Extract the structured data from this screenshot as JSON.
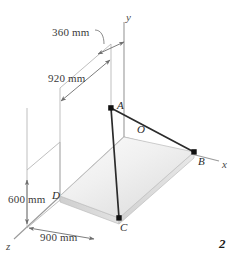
{
  "figure": {
    "page_number": "2",
    "dimensions": [
      {
        "id": "d360",
        "label": "360 mm",
        "x": 52,
        "y": 26
      },
      {
        "id": "d920",
        "label": "920 mm",
        "x": 48,
        "y": 72
      },
      {
        "id": "d600",
        "label": "600 mm",
        "x": 8,
        "y": 193
      },
      {
        "id": "d900",
        "label": "900 mm",
        "x": 40,
        "y": 231
      }
    ],
    "points": [
      {
        "id": "A",
        "label": "A",
        "x": 117,
        "y": 100,
        "dot_x": 111,
        "dot_y": 108
      },
      {
        "id": "B",
        "label": "B",
        "x": 198,
        "y": 155,
        "dot_x": 194,
        "dot_y": 152
      },
      {
        "id": "C",
        "label": "C",
        "x": 120,
        "y": 222,
        "dot_x": 119,
        "dot_y": 218
      },
      {
        "id": "D",
        "label": "D",
        "x": 52,
        "y": 190,
        "dot_x": 0,
        "dot_y": 0
      },
      {
        "id": "O",
        "label": "O",
        "x": 138,
        "y": 124,
        "dot_x": 0,
        "dot_y": 0
      }
    ],
    "axes": [
      {
        "id": "x",
        "label": "x",
        "x": 222,
        "y": 158
      },
      {
        "id": "y",
        "label": "y",
        "x": 126,
        "y": 12
      },
      {
        "id": "z",
        "label": "z",
        "x": 6,
        "y": 242
      }
    ],
    "colors": {
      "axis_line": "#9a9a9a",
      "dimension_line": "#6e6e6e",
      "member_line": "#2b2b2b",
      "plate_top": "#ededed",
      "plate_edge": "#c9c9c9",
      "plate_side": "#d6d6d6",
      "background": "#ffffff"
    }
  }
}
